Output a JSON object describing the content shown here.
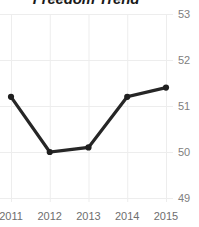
{
  "chart_data": {
    "type": "line",
    "title": "Freedom Trend",
    "xlabel": "",
    "ylabel": "",
    "categories": [
      "2011",
      "2012",
      "2013",
      "2014",
      "2015"
    ],
    "x": [
      2011,
      2012,
      2013,
      2014,
      2015
    ],
    "values": [
      51.2,
      50.0,
      50.1,
      51.2,
      51.4
    ],
    "series": [
      {
        "name": "Freedom Trend",
        "values": [
          51.2,
          50.0,
          50.1,
          51.2,
          51.4
        ]
      }
    ],
    "ylim": [
      49,
      53
    ],
    "xlim": [
      2011,
      2015
    ],
    "y_ticks": [
      53,
      52,
      51,
      50,
      49
    ],
    "y_tick_labels": [
      "53",
      "52",
      "51",
      "50",
      "49"
    ],
    "x_ticks": [
      2011,
      2012,
      2013,
      2014,
      2015
    ],
    "x_tick_labels": [
      "2011",
      "2012",
      "2013",
      "2014",
      "2015"
    ],
    "grid": true,
    "grid_axis": "both",
    "legend": false,
    "legend_position": "none",
    "markers": true,
    "y_axis_side": "right",
    "colors": {
      "line": "#262626",
      "marker": "#1f1f1f",
      "grid": "#ededed",
      "y_label": "#808080",
      "x_label": "#6e6e6e",
      "title": "#1a1a1a",
      "background": "#ffffff"
    }
  }
}
